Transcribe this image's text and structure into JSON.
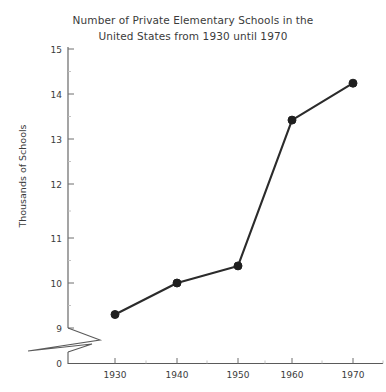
{
  "chart_data": {
    "type": "line",
    "title": "Number of Private Elementary Schools in the United States from 1930 until 1970",
    "title_line1": "Number of Private Elementary Schools in the",
    "title_line2": "United States from 1930 until 1970",
    "xlabel": "",
    "ylabel": "Thousands of Schools",
    "categories": [
      "1930",
      "1940",
      "1950",
      "1960",
      "1970"
    ],
    "x": [
      1930,
      1940,
      1950,
      1960,
      1970
    ],
    "values": [
      9.3,
      10.0,
      10.38,
      13.62,
      14.44
    ],
    "series": [
      {
        "name": "Thousands of Schools",
        "values": [
          9.3,
          10.0,
          10.38,
          13.62,
          14.44
        ]
      }
    ],
    "xtick_labels": [
      "1930",
      "1940",
      "1950",
      "1960",
      "1970"
    ],
    "ytick_labels": [
      "0",
      "9",
      "10",
      "11",
      "12",
      "13",
      "14",
      "15"
    ],
    "ylim": [
      9,
      15
    ],
    "xlim": [
      1925,
      1975
    ],
    "y_axis_break": true,
    "y_axis_break_label": "0",
    "grid": false,
    "legend": "none",
    "line_color": "#2b2b2b",
    "marker_color": "#1f1f1f",
    "axis_color": "#5a5a5a",
    "background_color": "#ffffff",
    "text_color": "#3b3b3b"
  }
}
